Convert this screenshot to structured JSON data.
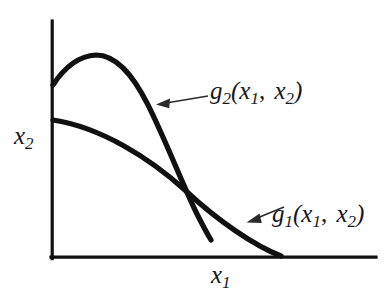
{
  "figure": {
    "background_color": "#ffffff",
    "ink_color": "#111111",
    "leader_color": "#2a2a2a"
  },
  "axes": {
    "x_axis_label": {
      "base": "x",
      "subscript": "1"
    },
    "y_axis_label": {
      "base": "x",
      "subscript": "2"
    },
    "origin": [
      51,
      257
    ],
    "x_axis_end": [
      376,
      257
    ],
    "y_axis_top": [
      51,
      21
    ]
  },
  "curves": [
    {
      "name": "g1",
      "label": {
        "base": "g",
        "subscript": "1",
        "open": "(",
        "arg1_base": "x",
        "arg1_sub": "1",
        "comma": ",",
        "arg2_base": "x",
        "arg2_sub": "2",
        "close": ")"
      },
      "description": "gently concave decreasing curve from y-axis to x-axis",
      "start": [
        53,
        120
      ],
      "end": [
        282,
        257
      ]
    },
    {
      "name": "g2",
      "label": {
        "base": "g",
        "subscript": "2",
        "open": "(",
        "arg1_base": "x",
        "arg1_sub": "1",
        "comma": ",",
        "arg2_base": "x",
        "arg2_sub": "2",
        "close": ")"
      },
      "description": "rises from y-axis to a peak then falls steeply, ending above the x-axis",
      "start": [
        53,
        85
      ],
      "peak": [
        95,
        55
      ],
      "end": [
        211,
        240
      ]
    }
  ],
  "intersection": [
    198,
    198
  ],
  "leaders": [
    {
      "name": "g2-leader",
      "from": [
        207,
        96
      ],
      "to": [
        157,
        104
      ]
    },
    {
      "name": "g1-leader",
      "from": [
        283,
        207
      ],
      "to": [
        247,
        222
      ]
    }
  ]
}
